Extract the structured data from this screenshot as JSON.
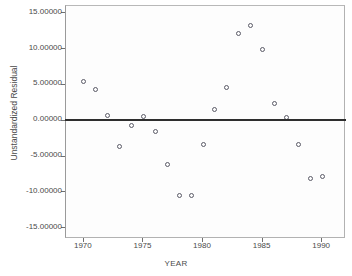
{
  "chart_data": {
    "type": "scatter",
    "title": "",
    "xlabel": "YEAR",
    "ylabel": "Unstandardized Residual",
    "xlim": [
      1968.5,
      1992.0
    ],
    "ylim": [
      -16.5,
      16.0
    ],
    "xticks": [
      1970,
      1975,
      1980,
      1985,
      1990
    ],
    "xtick_labels": [
      "1970",
      "1975",
      "1980",
      "1985",
      "1990"
    ],
    "yticks": [
      15,
      10,
      5,
      0,
      -5,
      -10,
      -15
    ],
    "ytick_labels": [
      "15.00000",
      "10.00000",
      "5.00000",
      "0.00000",
      "-5.00000",
      "-10.00000",
      "-15.00000"
    ],
    "grid": false,
    "legend": null,
    "reference_line": {
      "axis": "y",
      "value": 0,
      "color": "#2e2e2e"
    },
    "marker": {
      "shape": "open-circle",
      "edge_color": "#5a5a67",
      "fill": "none",
      "size": 5
    },
    "x": [
      1970,
      1971,
      1972,
      1973,
      1974,
      1975,
      1976,
      1977,
      1978,
      1979,
      1980,
      1981,
      1982,
      1983,
      1984,
      1985,
      1986,
      1987,
      1988,
      1989,
      1990
    ],
    "values": [
      5.4,
      4.35,
      0.7,
      -3.65,
      -0.7,
      0.55,
      -1.5,
      -6.1,
      -10.5,
      -10.5,
      -3.3,
      1.6,
      4.65,
      12.1,
      13.3,
      10.0,
      2.45,
      0.5,
      -3.35,
      -8.0,
      -7.8
    ],
    "points": [
      {
        "x": 1970,
        "y": 5.4
      },
      {
        "x": 1971,
        "y": 4.35
      },
      {
        "x": 1972,
        "y": 0.7
      },
      {
        "x": 1973,
        "y": -3.65
      },
      {
        "x": 1974,
        "y": -0.7
      },
      {
        "x": 1975,
        "y": 0.55
      },
      {
        "x": 1976,
        "y": -1.5
      },
      {
        "x": 1977,
        "y": -6.1
      },
      {
        "x": 1978,
        "y": -10.5
      },
      {
        "x": 1979,
        "y": -10.5
      },
      {
        "x": 1980,
        "y": -3.3
      },
      {
        "x": 1981,
        "y": 1.6
      },
      {
        "x": 1982,
        "y": 4.65
      },
      {
        "x": 1983,
        "y": 12.1
      },
      {
        "x": 1984,
        "y": 13.3
      },
      {
        "x": 1985,
        "y": 10.0
      },
      {
        "x": 1986,
        "y": 2.45
      },
      {
        "x": 1987,
        "y": 0.5
      },
      {
        "x": 1988,
        "y": -3.35
      },
      {
        "x": 1989,
        "y": -8.0
      },
      {
        "x": 1990,
        "y": -7.8
      }
    ]
  }
}
